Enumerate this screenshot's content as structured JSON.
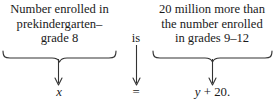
{
  "diagram": {
    "type": "verbal-model-to-equation",
    "text_color": "#1a1a1a",
    "background_color": "#ffffff",
    "left_phrase": {
      "line1": "Number enrolled in",
      "line2": "prekindergarten–",
      "line3": "grade 8"
    },
    "connector": {
      "word": "is",
      "symbol": "="
    },
    "right_phrase": {
      "line1": "20 million more than",
      "line2": "the number enrolled",
      "line3": "in grades 9–12"
    },
    "left_expression": {
      "variable": "x"
    },
    "right_expression": {
      "variable": "y",
      "operator": "+",
      "constant": "20."
    }
  }
}
